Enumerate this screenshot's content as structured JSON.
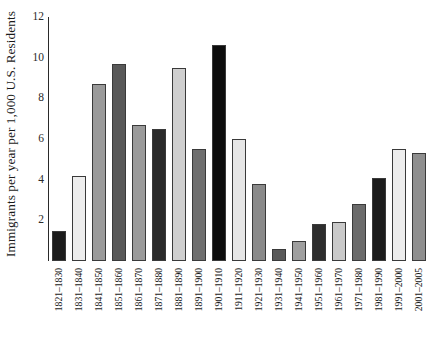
{
  "chart_data": {
    "type": "bar",
    "title": "",
    "xlabel": "",
    "ylabel": "Immigrants per year per 1,000 U.S. Residents",
    "ylim": [
      0,
      12
    ],
    "yticks": [
      2,
      4,
      6,
      8,
      10,
      12
    ],
    "ytick_labels": [
      "2",
      "4",
      "6",
      "8",
      "10",
      "12"
    ],
    "grid": false,
    "legend": "none",
    "categories": [
      "1821–1830",
      "1831–1840",
      "1841–1850",
      "1851–1860",
      "1861–1870",
      "1871–1880",
      "1881–1890",
      "1891–1900",
      "1901–1910",
      "1911–1920",
      "1921–1930",
      "1931–1940",
      "1941–1950",
      "1951–1960",
      "1961–1970",
      "1971–1980",
      "1981–1990",
      "1991–2000",
      "2001–2005"
    ],
    "values": [
      1.5,
      4.2,
      8.7,
      9.7,
      6.7,
      6.5,
      9.5,
      5.5,
      10.6,
      6.0,
      3.8,
      0.6,
      1.0,
      1.8,
      1.9,
      2.8,
      4.1,
      5.5,
      5.3
    ],
    "bar_colors": [
      "#1c1c1c",
      "#ededed",
      "#9a9a9a",
      "#595959",
      "#9a9a9a",
      "#2b2b2b",
      "#cfcfcf",
      "#6f6f6f",
      "#0d0d0d",
      "#e6e6e6",
      "#8a8a8a",
      "#5a5a5a",
      "#9f9f9f",
      "#2e2e2e",
      "#c9c9c9",
      "#6b6b6b",
      "#1c1c1c",
      "#ededed",
      "#8f8f8f"
    ]
  },
  "axis": {
    "axis_line_color": "#2a2a2a"
  }
}
